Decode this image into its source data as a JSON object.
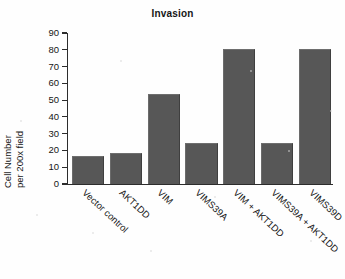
{
  "chart_data": {
    "type": "bar",
    "title": "Invasion",
    "xlabel": "",
    "ylabel": "Cell Number per 200x field",
    "ylabel_lines": [
      "Cell Number",
      "per 200x field"
    ],
    "categories": [
      "Vector control",
      "AKT1DD",
      "VIM",
      "VIMS39A",
      "VIM + AKT1DD",
      "VIMS39A + AKT1DD",
      "VIMS39D"
    ],
    "values": [
      16,
      18,
      53,
      24,
      80,
      24,
      80
    ],
    "ylim": [
      0,
      90
    ],
    "ytick_step": 10,
    "yticks": [
      0,
      10,
      20,
      30,
      40,
      50,
      60,
      70,
      80,
      90
    ],
    "ytick_labels": [
      "0",
      "10",
      "20",
      "30",
      "40",
      "50",
      "60",
      "70",
      "80",
      "90"
    ],
    "grid": false,
    "legend": null,
    "bar_color": "#575757",
    "axis_color": "#2c2c2c",
    "background": "#ffffff",
    "xtick_label_rotation": 43
  }
}
